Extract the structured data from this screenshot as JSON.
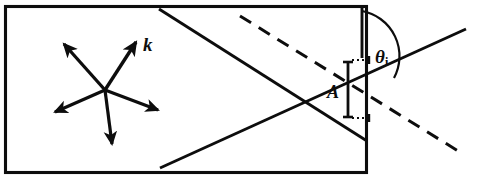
{
  "figure": {
    "background_color": "#ffffff",
    "ink_color": "#0d0d0d",
    "width": 477,
    "height": 181
  },
  "labels": {
    "wavevector": "k",
    "spacing": "A",
    "angle_symbol": "θ",
    "angle_subscript": "i"
  },
  "geometry": {
    "crystal_rect": {
      "x": 5,
      "y": 6,
      "width": 362,
      "height": 167
    },
    "star_center": {
      "x": 105,
      "y": 90
    },
    "star_arrow_tips": [
      {
        "x": 62,
        "y": 42,
        "name": "upper-left"
      },
      {
        "x": 138,
        "y": 40,
        "name": "upper-right-k"
      },
      {
        "x": 52,
        "y": 113,
        "name": "lower-left"
      },
      {
        "x": 161,
        "y": 111,
        "name": "lower-right"
      },
      {
        "x": 112,
        "y": 147,
        "name": "down"
      }
    ],
    "solid_line_down_right": {
      "x1": 159,
      "y1": 10,
      "x2": 367,
      "y2": 141
    },
    "solid_line_up_right": {
      "x1": 160,
      "y1": 167,
      "x2": 465,
      "y2": 30
    },
    "dashed_line": {
      "x1": 240,
      "y1": 17,
      "x2": 462,
      "y2": 153
    },
    "vertical_normal": {
      "x": 362,
      "y1": 8,
      "y2": 57
    },
    "spacing_bar": {
      "x": 348,
      "y1": 62,
      "y2": 117
    },
    "angle_arc": {
      "center_x": 362,
      "center_y": 57,
      "radius": 46
    }
  }
}
